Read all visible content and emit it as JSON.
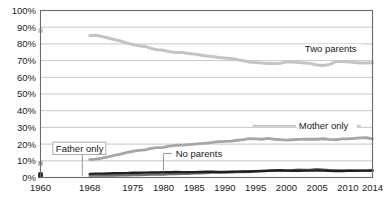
{
  "chart_data": {
    "type": "line",
    "title": "",
    "subtitle": "",
    "xlabel": "",
    "ylabel": "",
    "xlim": [
      1960,
      2014
    ],
    "ylim": [
      0,
      100
    ],
    "grid": true,
    "legend_position": "inline-annotations",
    "y_ticks": [
      "0%",
      "10%",
      "20%",
      "30%",
      "40%",
      "50%",
      "60%",
      "70%",
      "80%",
      "90%",
      "100%"
    ],
    "y_tick_values": [
      0,
      10,
      20,
      30,
      40,
      50,
      60,
      70,
      80,
      90,
      100
    ],
    "x_ticks": [
      "1960",
      "1968",
      "1975",
      "1980",
      "1985",
      "1990",
      "1995",
      "2000",
      "2005",
      "2010",
      "2014"
    ],
    "x_tick_values": [
      1960,
      1968,
      1975,
      1980,
      1985,
      1990,
      1995,
      2000,
      2005,
      2010,
      2014
    ],
    "annotations": [
      {
        "text": "Two parents",
        "x": 2003,
        "y": 75
      },
      {
        "text": "Mother only",
        "x": 2002,
        "y": 29
      },
      {
        "text": "Father only",
        "x": 1962.5,
        "y": 15.5
      },
      {
        "text": "No parents",
        "x": 1982,
        "y": 12.5
      }
    ],
    "series": [
      {
        "name": "Two parents",
        "color": "#c4c4c4",
        "stroke_width": 3.0,
        "marker_1960": {
          "x": 1960,
          "y": 88,
          "color": "#c4c4c4"
        },
        "x": [
          1968,
          1969,
          1970,
          1971,
          1972,
          1973,
          1974,
          1975,
          1976,
          1977,
          1978,
          1979,
          1980,
          1981,
          1982,
          1983,
          1984,
          1985,
          1986,
          1987,
          1988,
          1989,
          1990,
          1991,
          1992,
          1993,
          1994,
          1995,
          1996,
          1997,
          1998,
          1999,
          2000,
          2001,
          2002,
          2003,
          2004,
          2005,
          2006,
          2007,
          2008,
          2009,
          2010,
          2011,
          2012,
          2013,
          2014
        ],
        "values": [
          85.0,
          85.2,
          84.4,
          83.5,
          82.6,
          81.7,
          80.6,
          79.6,
          78.9,
          78.5,
          77.3,
          76.5,
          76.2,
          75.3,
          74.8,
          74.8,
          74.3,
          73.9,
          73.4,
          72.8,
          72.4,
          71.9,
          71.6,
          71.2,
          70.6,
          69.9,
          69.2,
          68.8,
          68.5,
          68.3,
          68.2,
          68.4,
          69.1,
          69.1,
          68.8,
          68.5,
          68.2,
          67.4,
          67.1,
          67.6,
          69.4,
          69.5,
          69.3,
          68.8,
          68.6,
          68.6,
          68.7
        ]
      },
      {
        "name": "Mother only",
        "color": "#a6a6a6",
        "stroke_width": 2.8,
        "marker_1960": {
          "x": 1960,
          "y": 8.5,
          "color": "#a6a6a6"
        },
        "x": [
          1968,
          1969,
          1970,
          1971,
          1972,
          1973,
          1974,
          1975,
          1976,
          1977,
          1978,
          1979,
          1980,
          1981,
          1982,
          1983,
          1984,
          1985,
          1986,
          1987,
          1988,
          1989,
          1990,
          1991,
          1992,
          1993,
          1994,
          1995,
          1996,
          1997,
          1998,
          1999,
          2000,
          2001,
          2002,
          2003,
          2004,
          2005,
          2006,
          2007,
          2008,
          2009,
          2010,
          2011,
          2012,
          2013,
          2014
        ],
        "values": [
          10.7,
          11.0,
          11.6,
          12.4,
          13.2,
          14.0,
          14.9,
          15.6,
          16.3,
          16.5,
          17.4,
          17.9,
          18.0,
          18.8,
          19.3,
          19.4,
          19.7,
          20.0,
          20.3,
          20.6,
          21.0,
          21.5,
          21.6,
          21.8,
          22.3,
          22.7,
          23.3,
          23.1,
          22.9,
          23.4,
          22.9,
          22.7,
          22.4,
          22.6,
          22.8,
          22.9,
          23.0,
          22.9,
          23.2,
          22.8,
          22.6,
          23.1,
          23.2,
          23.4,
          23.7,
          23.8,
          23.1
        ]
      },
      {
        "name": "Father only",
        "color": "#6e6e6e",
        "stroke_width": 2.4,
        "marker_1960": {
          "x": 1960,
          "y": 1.0,
          "color": "#3a3a3a"
        },
        "x": [
          1968,
          1969,
          1970,
          1971,
          1972,
          1973,
          1974,
          1975,
          1976,
          1977,
          1978,
          1979,
          1980,
          1981,
          1982,
          1983,
          1984,
          1985,
          1986,
          1987,
          1988,
          1989,
          1990,
          1991,
          1992,
          1993,
          1994,
          1995,
          1996,
          1997,
          1998,
          1999,
          2000,
          2001,
          2002,
          2003,
          2004,
          2005,
          2006,
          2007,
          2008,
          2009,
          2010,
          2011,
          2012,
          2013,
          2014
        ],
        "values": [
          1.1,
          1.1,
          1.2,
          1.2,
          1.2,
          1.3,
          1.3,
          1.5,
          1.5,
          1.6,
          1.7,
          1.8,
          1.8,
          2.0,
          2.1,
          2.2,
          2.2,
          2.5,
          2.5,
          2.6,
          2.9,
          3.0,
          3.1,
          3.1,
          3.3,
          3.3,
          3.4,
          3.5,
          3.8,
          4.0,
          4.1,
          4.2,
          4.2,
          4.3,
          4.6,
          4.5,
          4.6,
          4.9,
          4.6,
          4.3,
          4.2,
          4.0,
          4.0,
          4.1,
          4.0,
          4.1,
          4.2
        ]
      },
      {
        "name": "No parents",
        "color": "#1f1f1f",
        "stroke_width": 2.4,
        "marker_1960": {
          "x": 1960,
          "y": 1.8,
          "color": "#1f1f1f"
        },
        "x": [
          1968,
          1969,
          1970,
          1971,
          1972,
          1973,
          1974,
          1975,
          1976,
          1977,
          1978,
          1979,
          1980,
          1981,
          1982,
          1983,
          1984,
          1985,
          1986,
          1987,
          1988,
          1989,
          1990,
          1991,
          1992,
          1993,
          1994,
          1995,
          1996,
          1997,
          1998,
          1999,
          2000,
          2001,
          2002,
          2003,
          2004,
          2005,
          2006,
          2007,
          2008,
          2009,
          2010,
          2011,
          2012,
          2013,
          2014
        ],
        "values": [
          2.2,
          2.3,
          2.3,
          2.4,
          2.5,
          2.5,
          2.6,
          2.8,
          2.8,
          2.9,
          3.0,
          3.0,
          3.2,
          3.1,
          3.3,
          3.2,
          3.2,
          3.2,
          3.3,
          3.4,
          3.4,
          3.3,
          3.3,
          3.4,
          3.5,
          3.6,
          3.6,
          3.8,
          3.9,
          4.0,
          4.2,
          4.3,
          4.1,
          4.0,
          4.0,
          4.1,
          4.1,
          4.2,
          4.1,
          4.0,
          3.9,
          3.9,
          4.0,
          4.0,
          4.1,
          4.1,
          4.2
        ]
      }
    ]
  }
}
